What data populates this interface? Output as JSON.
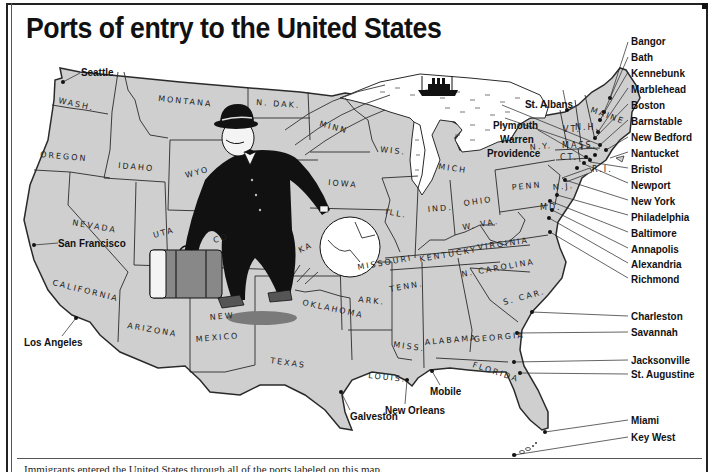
{
  "title": "Ports of entry to the United States",
  "caption": "Immigrants entered the United States through all of the ports labeled on this map.",
  "colors": {
    "land": "#cfcfcf",
    "water": "#ffffff",
    "border": "#2a2a2a",
    "figure": "#111111",
    "suitcase": "#888888"
  },
  "states": [
    {
      "name": "WASH",
      "label": "WASH."
    },
    {
      "name": "OREGON",
      "label": "OREGON"
    },
    {
      "name": "CALIFORNIA",
      "label": "CALIFORNIA"
    },
    {
      "name": "IDAHO",
      "label": "IDAHO"
    },
    {
      "name": "NEVADA",
      "label": "NEVADA"
    },
    {
      "name": "MONTANA",
      "label": "MONTANA"
    },
    {
      "name": "WYO",
      "label": "WYO"
    },
    {
      "name": "UTAH",
      "label": "UTA"
    },
    {
      "name": "COLORADO",
      "label": "CO"
    },
    {
      "name": "ARIZONA",
      "label": "ARIZONA"
    },
    {
      "name": "NEW MEXICO",
      "label_line1": "NEW",
      "label_line2": "MEXICO"
    },
    {
      "name": "N. DAK",
      "label": "N. DAK."
    },
    {
      "name": "KANSAS",
      "label": "KA"
    },
    {
      "name": "OKLAHOMA",
      "label": "OKLAHOMA"
    },
    {
      "name": "TEXAS",
      "label": "TEXAS"
    },
    {
      "name": "MINN",
      "label": "MINN"
    },
    {
      "name": "IOWA",
      "label": "IOWA"
    },
    {
      "name": "MISSOURI",
      "label": "MISSOURI"
    },
    {
      "name": "ARK",
      "label": "ARK."
    },
    {
      "name": "LOUIS",
      "label": "LOUIS."
    },
    {
      "name": "WIS",
      "label": "WIS."
    },
    {
      "name": "ILL",
      "label": "ILL."
    },
    {
      "name": "MICH",
      "label": "MICH"
    },
    {
      "name": "IND",
      "label": "IND."
    },
    {
      "name": "OHIO",
      "label": "OHIO"
    },
    {
      "name": "KENTUCKY",
      "label": "KENTUCKY"
    },
    {
      "name": "TENN",
      "label": "TENN."
    },
    {
      "name": "MISS",
      "label": "MISS."
    },
    {
      "name": "ALABAMA",
      "label": "ALABAMA"
    },
    {
      "name": "GEORGIA",
      "label": "GEORGIA"
    },
    {
      "name": "FLORIDA",
      "label": "FLORIDA"
    },
    {
      "name": "S. CAR",
      "label": "S. CAR."
    },
    {
      "name": "N. CAROLINA",
      "label": "N. CAROLINA"
    },
    {
      "name": "VIRGINIA",
      "label": "VIRGINIA"
    },
    {
      "name": "W. VA",
      "label": "W. VA."
    },
    {
      "name": "PENN",
      "label": "PENN"
    },
    {
      "name": "N.Y.",
      "label": "N.Y."
    },
    {
      "name": "N.J.",
      "label": "N.J."
    },
    {
      "name": "MD",
      "label": "MD."
    },
    {
      "name": "VT",
      "label": "VT."
    },
    {
      "name": "N.H.",
      "label": "N.H."
    },
    {
      "name": "MAINE",
      "label": "MAINE"
    },
    {
      "name": "MASS",
      "label": "MASS."
    },
    {
      "name": "CT",
      "label": "CT."
    },
    {
      "name": "R.I.",
      "label": "R.I."
    }
  ],
  "ports": {
    "west": [
      {
        "name": "Seattle",
        "x": 60,
        "y": 79
      },
      {
        "name": "San Francisco",
        "x": 35,
        "y": 246
      },
      {
        "name": "Los Angeles",
        "x": 76,
        "y": 320
      }
    ],
    "gulf": [
      {
        "name": "Galveston",
        "x": 341,
        "y": 393
      },
      {
        "name": "New Orleans",
        "x": 407,
        "y": 382
      },
      {
        "name": "Mobile",
        "x": 432,
        "y": 372
      }
    ],
    "east": [
      {
        "name": "St. Albans"
      },
      {
        "name": "Plymouth"
      },
      {
        "name": "Warren"
      },
      {
        "name": "Providence"
      },
      {
        "name": "Bangor"
      },
      {
        "name": "Bath"
      },
      {
        "name": "Kennebunk"
      },
      {
        "name": "Marblehead"
      },
      {
        "name": "Boston"
      },
      {
        "name": "Barnstable"
      },
      {
        "name": "New Bedford"
      },
      {
        "name": "Nantucket"
      },
      {
        "name": "Bristol"
      },
      {
        "name": "Newport"
      },
      {
        "name": "New York"
      },
      {
        "name": "Philadelphia"
      },
      {
        "name": "Baltimore"
      },
      {
        "name": "Annapolis"
      },
      {
        "name": "Alexandria"
      },
      {
        "name": "Richmond"
      },
      {
        "name": "Charleston"
      },
      {
        "name": "Savannah"
      },
      {
        "name": "Jacksonville"
      },
      {
        "name": "St. Augustine"
      },
      {
        "name": "Miami"
      },
      {
        "name": "Key West"
      }
    ]
  }
}
